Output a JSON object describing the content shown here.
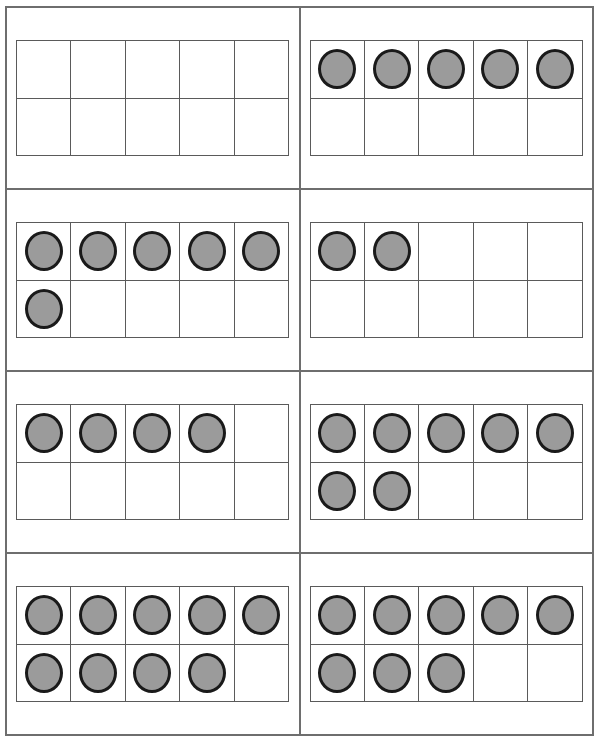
{
  "worksheet": {
    "title": "Ten Frame Counting Worksheet",
    "description": "Eight ten-frames showing counters arranged in two rows of five",
    "colors": {
      "counter_fill": "#9b9b9b",
      "counter_stroke": "#1a1a1a",
      "frame_line": "#5a5a5a",
      "panel_border": "#6e6e6e",
      "background": "#ffffff"
    },
    "grid": {
      "columns": 2,
      "rows": 4,
      "frame_columns": 5,
      "frame_rows": 2,
      "frame_capacity": 10
    },
    "panels": [
      {
        "id": "panel-1",
        "position": "row1-left",
        "count": 0,
        "top_row_filled": 0,
        "bottom_row_filled": 0,
        "cells": [
          false,
          false,
          false,
          false,
          false,
          false,
          false,
          false,
          false,
          false
        ]
      },
      {
        "id": "panel-2",
        "position": "row1-right",
        "count": 5,
        "top_row_filled": 5,
        "bottom_row_filled": 0,
        "cells": [
          true,
          true,
          true,
          true,
          true,
          false,
          false,
          false,
          false,
          false
        ]
      },
      {
        "id": "panel-3",
        "position": "row2-left",
        "count": 6,
        "top_row_filled": 5,
        "bottom_row_filled": 1,
        "cells": [
          true,
          true,
          true,
          true,
          true,
          true,
          false,
          false,
          false,
          false
        ]
      },
      {
        "id": "panel-4",
        "position": "row2-right",
        "count": 2,
        "top_row_filled": 2,
        "bottom_row_filled": 0,
        "cells": [
          true,
          true,
          false,
          false,
          false,
          false,
          false,
          false,
          false,
          false
        ]
      },
      {
        "id": "panel-5",
        "position": "row3-left",
        "count": 4,
        "top_row_filled": 4,
        "bottom_row_filled": 0,
        "cells": [
          true,
          true,
          true,
          true,
          false,
          false,
          false,
          false,
          false,
          false
        ]
      },
      {
        "id": "panel-6",
        "position": "row3-right",
        "count": 7,
        "top_row_filled": 5,
        "bottom_row_filled": 2,
        "cells": [
          true,
          true,
          true,
          true,
          true,
          true,
          true,
          false,
          false,
          false
        ]
      },
      {
        "id": "panel-7",
        "position": "row4-left",
        "count": 9,
        "top_row_filled": 5,
        "bottom_row_filled": 4,
        "cells": [
          true,
          true,
          true,
          true,
          true,
          true,
          true,
          true,
          true,
          false
        ]
      },
      {
        "id": "panel-8",
        "position": "row4-right",
        "count": 8,
        "top_row_filled": 5,
        "bottom_row_filled": 3,
        "cells": [
          true,
          true,
          true,
          true,
          true,
          true,
          true,
          true,
          false,
          false
        ]
      }
    ]
  }
}
